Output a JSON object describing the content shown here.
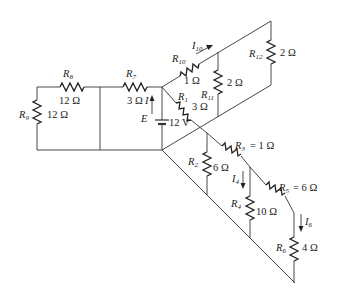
{
  "diagram": {
    "type": "circuit-schematic",
    "source": {
      "name": "E",
      "value": "12 V",
      "current_label": "I"
    },
    "resistors": [
      {
        "id": "R1",
        "name": "R",
        "sub": "1",
        "value": "3 Ω"
      },
      {
        "id": "R2",
        "name": "R",
        "sub": "2",
        "value": "6 Ω"
      },
      {
        "id": "R3",
        "name": "R",
        "sub": "3",
        "value": "= 1 Ω"
      },
      {
        "id": "R4",
        "name": "R",
        "sub": "4",
        "value": "10 Ω"
      },
      {
        "id": "R5",
        "name": "R",
        "sub": "5",
        "value": "= 6 Ω"
      },
      {
        "id": "R6",
        "name": "R",
        "sub": "6",
        "value": "4 Ω"
      },
      {
        "id": "R7",
        "name": "R",
        "sub": "7",
        "value": "3 Ω"
      },
      {
        "id": "R8",
        "name": "R",
        "sub": "8",
        "value": "12 Ω"
      },
      {
        "id": "R9",
        "name": "R",
        "sub": "9",
        "value": "12 Ω"
      },
      {
        "id": "R10",
        "name": "R",
        "sub": "10",
        "value": "1 Ω"
      },
      {
        "id": "R11",
        "name": "R",
        "sub": "11",
        "value": "2 Ω"
      },
      {
        "id": "R12",
        "name": "R",
        "sub": "12",
        "value": "2 Ω"
      }
    ],
    "currents": [
      {
        "id": "I10",
        "name": "I",
        "sub": "10"
      },
      {
        "id": "I4",
        "name": "I",
        "sub": "4"
      },
      {
        "id": "I6",
        "name": "I",
        "sub": "6"
      }
    ]
  }
}
